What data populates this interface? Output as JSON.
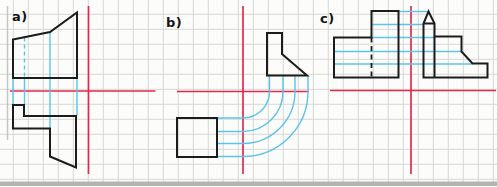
{
  "canvas": {
    "width": 497,
    "height": 186,
    "background": "#fcfcfa"
  },
  "colors": {
    "grid": "#d7d7d7",
    "axis_red": "#e3294e",
    "projection_cyan": "#5cc4e8",
    "outline_black": "#1c1c1e",
    "page_edge_gray": "#b4b4b4"
  },
  "grid": {
    "spacing": 15,
    "offset_x": 13.3,
    "offset_y": 14.3
  },
  "page_edges": {
    "bottom_strip": {
      "x": 0,
      "y": 181.5,
      "width": 497,
      "height": 4.5
    },
    "left_line": {
      "x": 7.5,
      "y1": 6,
      "y2": 140
    }
  },
  "sections": [
    {
      "id": "a",
      "label": "a)",
      "label_pos": {
        "x": 12,
        "y": 9
      },
      "axis_v": {
        "x": 88.5,
        "y1": 6,
        "y2": 174
      },
      "axis_h": {
        "y": 91,
        "x1": 10,
        "x2": 155.5
      },
      "outlines": [
        {
          "name": "upper-view",
          "points": [
            [
              13,
              39.5
            ],
            [
              50,
              32
            ],
            [
              77,
              12.5
            ],
            [
              77,
              78
            ],
            [
              13,
              78
            ]
          ]
        },
        {
          "name": "lower-view",
          "points": [
            [
              13,
              105
            ],
            [
              24,
              105
            ],
            [
              24,
              116
            ],
            [
              76,
              116
            ],
            [
              76,
              167.5
            ],
            [
              50,
              156.5
            ],
            [
              50,
              128.5
            ],
            [
              13,
              128.5
            ]
          ]
        }
      ],
      "hidden_edges": [],
      "inner_edges": [],
      "projection_segments": [
        {
          "x1": 13,
          "y1": 78,
          "x2": 13,
          "y2": 105,
          "dashed": false
        },
        {
          "x1": 24.5,
          "y1": 37.5,
          "x2": 24.5,
          "y2": 78,
          "dashed": true
        },
        {
          "x1": 24.5,
          "y1": 78,
          "x2": 24.5,
          "y2": 105,
          "dashed": false
        },
        {
          "x1": 50,
          "y1": 32,
          "x2": 50,
          "y2": 128.5,
          "dashed": false
        },
        {
          "x1": 77,
          "y1": 78,
          "x2": 77,
          "y2": 116,
          "dashed": false
        }
      ],
      "projection_arcs": []
    },
    {
      "id": "b",
      "label": "b)",
      "label_pos": {
        "x": 166,
        "y": 15
      },
      "axis_v": {
        "x": 243,
        "y1": 6,
        "y2": 174
      },
      "axis_h": {
        "y": 91.5,
        "x1": 177,
        "x2": 309
      },
      "outlines": [
        {
          "name": "front-view-square",
          "points": [
            [
              177,
              118
            ],
            [
              217,
              118
            ],
            [
              217,
              157
            ],
            [
              177,
              157
            ]
          ]
        },
        {
          "name": "side-view",
          "points": [
            [
              267,
              33
            ],
            [
              282,
              33
            ],
            [
              282,
              54
            ],
            [
              307,
              75.5
            ],
            [
              267,
              75.5
            ]
          ]
        }
      ],
      "hidden_edges": [],
      "inner_edges": [],
      "projection_segments": [],
      "projection_arcs": [
        {
          "cx": 243,
          "cy": 91.5,
          "r": 26.5,
          "from_y": 75.5,
          "to_x": 217
        },
        {
          "cx": 243,
          "cy": 91.5,
          "r": 40,
          "from_y": 75.5,
          "to_x": 217
        },
        {
          "cx": 243,
          "cy": 91.5,
          "r": 52,
          "from_y": 75.5,
          "to_x": 217
        },
        {
          "cx": 243,
          "cy": 91.5,
          "r": 65,
          "from_y": 75.5,
          "to_x": 217
        }
      ]
    },
    {
      "id": "c",
      "label": "c)",
      "label_pos": {
        "x": 320,
        "y": 11
      },
      "axis_v": {
        "x": 411,
        "y1": 6,
        "y2": 174
      },
      "axis_h": {
        "y": 90.5,
        "x1": 330,
        "x2": 496
      },
      "outlines": [
        {
          "name": "left-view",
          "points": [
            [
              334,
              37.5
            ],
            [
              371.5,
              37.5
            ],
            [
              371.5,
              11
            ],
            [
              398.5,
              11
            ],
            [
              398.5,
              77.5
            ],
            [
              334,
              77.5
            ]
          ]
        },
        {
          "name": "right-view-tower",
          "points": [
            [
              428.5,
              11.5
            ],
            [
              434.5,
              23.5
            ],
            [
              434.5,
              36.5
            ],
            [
              461.5,
              36.5
            ],
            [
              461.5,
              51.5
            ],
            [
              472.5,
              63.5
            ],
            [
              487.5,
              63.5
            ],
            [
              487.5,
              77.5
            ],
            [
              423.5,
              77.5
            ],
            [
              423.5,
              23.5
            ]
          ]
        }
      ],
      "hidden_edges": [
        {
          "x1": 371.5,
          "y1": 37.5,
          "x2": 371.5,
          "y2": 77.5
        }
      ],
      "inner_edges": [
        {
          "x1": 423.5,
          "y1": 23.5,
          "x2": 434.5,
          "y2": 23.5
        },
        {
          "x1": 434.5,
          "y1": 36.5,
          "x2": 434.5,
          "y2": 77.5
        }
      ],
      "projection_segments": [
        {
          "x1": 398.5,
          "y1": 11.5,
          "x2": 428.5,
          "y2": 11.5,
          "dashed": false
        },
        {
          "x1": 371.5,
          "y1": 24.5,
          "x2": 423.5,
          "y2": 24.5,
          "dashed": false
        },
        {
          "x1": 371.5,
          "y1": 37.5,
          "x2": 434.5,
          "y2": 37.5,
          "dashed": false
        },
        {
          "x1": 334,
          "y1": 51.5,
          "x2": 461.5,
          "y2": 51.5,
          "dashed": false
        },
        {
          "x1": 334,
          "y1": 64,
          "x2": 472.5,
          "y2": 64,
          "dashed": false
        }
      ],
      "projection_arcs": []
    }
  ]
}
